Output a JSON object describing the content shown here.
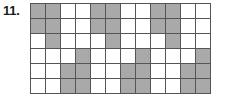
{
  "problem": {
    "number_label": "11.",
    "type": "shaded-grid-pattern"
  },
  "grid": {
    "columns": 12,
    "rows": 6,
    "cell_size_px": 15,
    "fill_color": "#a9a9a9",
    "empty_color": "#ffffff",
    "line_color": "#555555",
    "border_color": "#4d4d4d",
    "filled_count": 30,
    "empty_count": 42,
    "cells": [
      [
        1,
        1,
        0,
        0,
        1,
        1,
        0,
        0,
        1,
        1,
        0,
        0
      ],
      [
        1,
        1,
        0,
        0,
        1,
        1,
        0,
        0,
        1,
        1,
        0,
        0
      ],
      [
        0,
        1,
        0,
        0,
        0,
        1,
        0,
        0,
        0,
        1,
        0,
        0
      ],
      [
        0,
        0,
        0,
        1,
        0,
        0,
        0,
        1,
        0,
        0,
        0,
        1
      ],
      [
        0,
        0,
        1,
        1,
        0,
        0,
        1,
        1,
        0,
        0,
        1,
        1
      ],
      [
        0,
        0,
        1,
        1,
        0,
        0,
        1,
        1,
        0,
        0,
        1,
        1
      ]
    ]
  }
}
